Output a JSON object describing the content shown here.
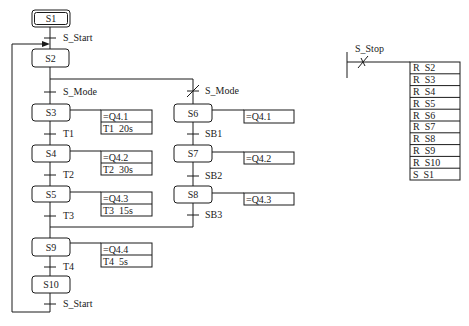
{
  "diagram": {
    "steps": {
      "s1": "S1",
      "s2": "S2",
      "s3": "S3",
      "s4": "S4",
      "s5": "S5",
      "s6": "S6",
      "s7": "S7",
      "s8": "S8",
      "s9": "S9",
      "s10": "S10"
    },
    "transitions": {
      "start_top": "S_Start",
      "mode_left": "S_Mode",
      "mode_right": "S_Mode",
      "t1": "T1",
      "t2": "T2",
      "t3": "T3",
      "t4": "T4",
      "sb1": "SB1",
      "sb2": "SB2",
      "sb3": "SB3",
      "start_bottom": "S_Start"
    },
    "actions": {
      "s3": {
        "output": "=Q4.1",
        "timer": "T1  20s"
      },
      "s4": {
        "output": "=Q4.2",
        "timer": "T2  30s"
      },
      "s5": {
        "output": "=Q4.3",
        "timer": "T3  15s"
      },
      "s9": {
        "output": "=Q4.4",
        "timer": "T4  5s"
      },
      "s6": {
        "output": "=Q4.1"
      },
      "s7": {
        "output": "=Q4.2"
      },
      "s8": {
        "output": "=Q4.3"
      }
    }
  },
  "stop_rung": {
    "contact": "S_Stop",
    "coils": [
      "R  S2",
      "R  S3",
      "R  S4",
      "R  S5",
      "R  S6",
      "R  S7",
      "R  S8",
      "R  S9",
      "R  S10",
      "S  S1"
    ]
  }
}
